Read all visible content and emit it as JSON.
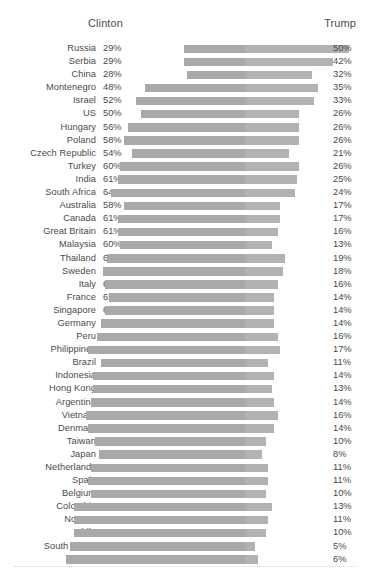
{
  "header": {
    "left_label": "Clinton",
    "right_label": "Trump"
  },
  "chart_data": {
    "type": "bar",
    "title": "",
    "subtitle": "",
    "xlabel": "",
    "ylabel": "",
    "legend_position": "top",
    "grid": false,
    "orientation": "horizontal",
    "layout": "centered diverging bars; bar length spans Clinton share then Trump share",
    "categories": [
      "Russia",
      "Serbia",
      "China",
      "Montenegro",
      "Israel",
      "US",
      "Hungary",
      "Poland",
      "Czech Republic",
      "Turkey",
      "India",
      "South Africa",
      "Australia",
      "Canada",
      "Great Britain",
      "Malaysia",
      "Thailand",
      "Sweden",
      "Italy",
      "France",
      "Singapore",
      "Germany",
      "Peru",
      "Philippines",
      "Brazil",
      "Indonesia",
      "Hong Kong",
      "Argentina",
      "Vietnam",
      "Denmark",
      "Taiwan",
      "Japan",
      "Netherlands",
      "Spain",
      "Belgium",
      "Colombia",
      "Norway",
      "Chile",
      "South Korea",
      "Mexico"
    ],
    "series": [
      {
        "name": "Clinton",
        "values": [
          29,
          29,
          28,
          48,
          52,
          50,
          56,
          58,
          54,
          60,
          61,
          64,
          58,
          61,
          61,
          60,
          66,
          68,
          67,
          65,
          67,
          69,
          71,
          75,
          69,
          73,
          73,
          74,
          76,
          75,
          72,
          70,
          74,
          75,
          74,
          82,
          82,
          82,
          84,
          86
        ]
      },
      {
        "name": "Trump",
        "values": [
          50,
          42,
          32,
          35,
          33,
          26,
          26,
          26,
          21,
          26,
          25,
          24,
          17,
          17,
          16,
          13,
          19,
          18,
          16,
          14,
          14,
          14,
          16,
          17,
          11,
          14,
          13,
          14,
          16,
          14,
          10,
          8,
          11,
          11,
          10,
          13,
          11,
          10,
          5,
          6
        ]
      }
    ],
    "clinton_labels": [
      "29%",
      "29%",
      "28%",
      "48%",
      "52%",
      "50%",
      "56%",
      "58%",
      "54%",
      "60%",
      "61%",
      "64%",
      "58%",
      "61%",
      "61%",
      "60%",
      "66%",
      "68%",
      "67%",
      "65%",
      "67%",
      "69%",
      "71%",
      "75%",
      "69%",
      "73%",
      "73%",
      "74%",
      "76%",
      "75%",
      "72%",
      "70%",
      "74%",
      "75%",
      "74%",
      "82%",
      "82%",
      "82%",
      "84%",
      "86%"
    ],
    "trump_labels": [
      "50%",
      "42%",
      "32%",
      "35%",
      "33%",
      "26%",
      "26%",
      "26%",
      "21%",
      "26%",
      "25%",
      "24%",
      "17%",
      "17%",
      "16%",
      "13%",
      "19%",
      "18%",
      "16%",
      "14%",
      "14%",
      "14%",
      "16%",
      "17%",
      "11%",
      "14%",
      "13%",
      "14%",
      "16%",
      "14%",
      "10%",
      "8%",
      "11%",
      "11%",
      "10%",
      "13%",
      "11%",
      "10%",
      "5%",
      "6%"
    ],
    "colors": {
      "clinton_bar": "#a9a9a9",
      "trump_bar": "#b2b2b2",
      "text": "#4a4a4a",
      "background": "#ffffff",
      "footer_rule": "#d8d8d8"
    }
  }
}
